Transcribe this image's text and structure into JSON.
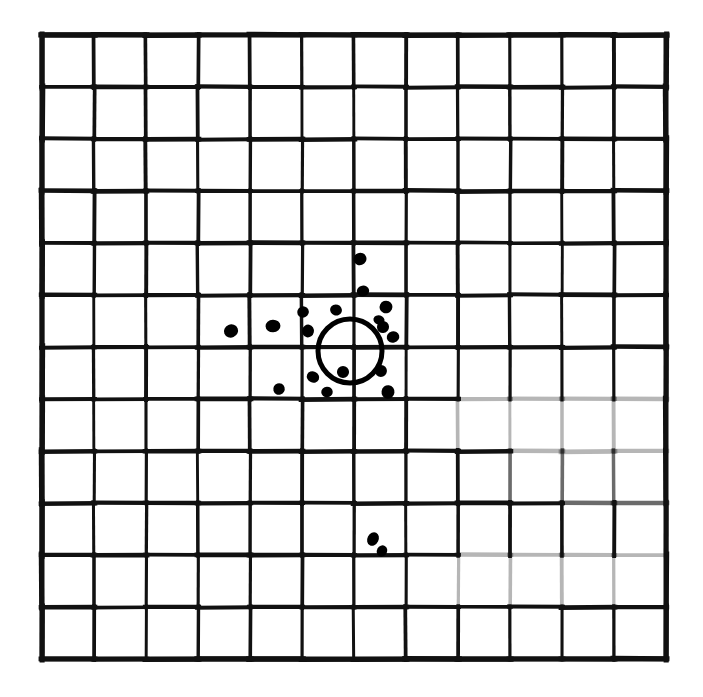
{
  "figure": {
    "background_color": "#ffffff",
    "ink_color": "#111111"
  },
  "grid": {
    "name": "target-grid",
    "columns": 12,
    "rows": 12,
    "origin_x": 42,
    "origin_y": 35,
    "cell_size": 52,
    "line_color": "#111111",
    "line_width_major": 4.2,
    "line_width_minor": 3.4,
    "border_width": 5.0,
    "faded_segments_note": "Several grid segments on the right and lower-right are faint or broken from photocopying"
  },
  "circle": {
    "name": "aim-circle",
    "center_x": 350,
    "center_y": 351,
    "radius": 32,
    "stroke_width": 5.0,
    "stroke_color": "#000000",
    "fill": "none"
  },
  "chart_data": {
    "type": "scatter",
    "xlabel": "",
    "ylabel": "",
    "xlim": [
      42,
      666
    ],
    "ylim": [
      35,
      659
    ],
    "grid": true,
    "legend": null,
    "marker_color": "#000000",
    "series": [
      {
        "name": "cluster-around-circle",
        "count": 17,
        "points": [
          {
            "x": 360,
            "y": 259,
            "r": 6.4
          },
          {
            "x": 363,
            "y": 291,
            "r": 5.8
          },
          {
            "x": 273,
            "y": 326,
            "r": 6.8
          },
          {
            "x": 231,
            "y": 331,
            "r": 6.6
          },
          {
            "x": 303,
            "y": 312,
            "r": 6.2
          },
          {
            "x": 308,
            "y": 331,
            "r": 6.0
          },
          {
            "x": 336,
            "y": 310,
            "r": 6.2
          },
          {
            "x": 386,
            "y": 307,
            "r": 5.6
          },
          {
            "x": 383,
            "y": 327,
            "r": 5.2
          },
          {
            "x": 393,
            "y": 337,
            "r": 5.4
          },
          {
            "x": 379,
            "y": 320,
            "r": 5.0
          },
          {
            "x": 313,
            "y": 377,
            "r": 6.0
          },
          {
            "x": 343,
            "y": 372,
            "r": 5.8
          },
          {
            "x": 327,
            "y": 392,
            "r": 5.6
          },
          {
            "x": 279,
            "y": 389,
            "r": 5.2
          },
          {
            "x": 381,
            "y": 371,
            "r": 5.6
          },
          {
            "x": 388,
            "y": 392,
            "r": 5.8
          }
        ]
      },
      {
        "name": "outliers-below",
        "count": 2,
        "points": [
          {
            "x": 373,
            "y": 539,
            "r": 6.2
          },
          {
            "x": 382,
            "y": 551,
            "r": 5.0
          }
        ]
      }
    ]
  }
}
